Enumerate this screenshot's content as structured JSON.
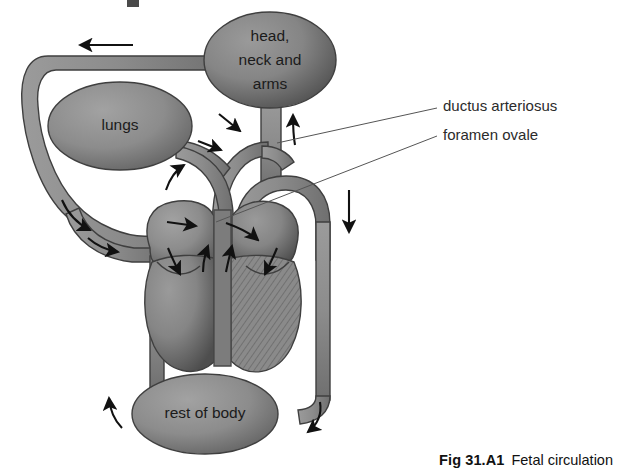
{
  "figure": {
    "caption_label": "Fig 31.A1",
    "caption_body": "Fetal circulation",
    "background_color": "#ffffff"
  },
  "colors": {
    "vessel_fill": "#8e8e8e",
    "vessel_stroke": "#3c3c3c",
    "organ_fill": "#8a8a8a",
    "organ_shadow": "#5e5e5e",
    "heart_fill": "#878787",
    "heart_hatch": "#6d6d6d",
    "arrow": "#111111",
    "leader_line": "#555555",
    "text": "#1b1b1b",
    "callout_text": "#2b2b2b"
  },
  "organs": [
    {
      "name": "head-neck-arms",
      "lines": [
        "head,",
        "neck and",
        "arms"
      ],
      "cx": 270,
      "cy": 60,
      "rx": 66,
      "ry": 48
    },
    {
      "name": "lungs",
      "lines": [
        "lungs"
      ],
      "cx": 120,
      "cy": 126,
      "rx": 72,
      "ry": 44
    },
    {
      "name": "rest-of-body",
      "lines": [
        "rest of body"
      ],
      "cx": 205,
      "cy": 414,
      "rx": 73,
      "ry": 40
    }
  ],
  "callouts": [
    {
      "name": "ductus-arteriosus",
      "label": "ductus arteriosus",
      "text_x": 443,
      "text_y": 107,
      "leader": [
        [
          437,
          108
        ],
        [
          277,
          143
        ]
      ]
    },
    {
      "name": "foramen-ovale",
      "label": "foramen ovale",
      "text_x": 443,
      "text_y": 136,
      "leader": [
        [
          437,
          136
        ],
        [
          216,
          222
        ]
      ]
    }
  ],
  "flow_arrows": [
    {
      "name": "arrow-superior-vena-cava-left",
      "direction": "left",
      "x": 95,
      "y": 45
    },
    {
      "name": "arrow-aorta-descending-down",
      "direction": "down",
      "x": 327,
      "y": 215
    },
    {
      "name": "arrow-head-artery-up",
      "direction": "up",
      "x": 291,
      "y": 128
    },
    {
      "name": "arrow-pulmonary-trunk-right",
      "direction": "right",
      "x": 232,
      "y": 125
    },
    {
      "name": "arrow-pulmonary-branch-right",
      "direction": "right",
      "x": 215,
      "y": 148
    },
    {
      "name": "arrow-vena-cava-inflow-up",
      "direction": "up",
      "x": 172,
      "y": 175
    },
    {
      "name": "arrow-lower-body-return",
      "direction": "down",
      "x": 80,
      "y": 218
    },
    {
      "name": "arrow-lower-body-inflow",
      "direction": "down",
      "x": 110,
      "y": 243
    },
    {
      "name": "arrow-foramen-ovale-right",
      "direction": "right",
      "x": 185,
      "y": 227
    },
    {
      "name": "arrow-foramen-ovale-cross",
      "direction": "right",
      "x": 245,
      "y": 232
    },
    {
      "name": "arrow-right-atrium-ventricle",
      "direction": "down",
      "x": 175,
      "y": 260
    },
    {
      "name": "arrow-left-atrium-ventricle",
      "direction": "down",
      "x": 255,
      "y": 260
    },
    {
      "name": "arrow-septum-up-left",
      "direction": "up",
      "x": 205,
      "y": 255
    },
    {
      "name": "arrow-septum-up-right",
      "direction": "up",
      "x": 222,
      "y": 255
    },
    {
      "name": "arrow-body-return-left",
      "direction": "up",
      "x": 108,
      "y": 405
    },
    {
      "name": "arrow-body-supply-right",
      "direction": "down",
      "x": 310,
      "y": 405
    }
  ]
}
